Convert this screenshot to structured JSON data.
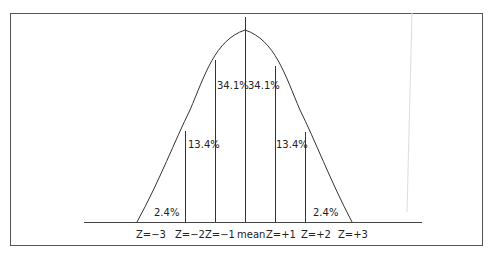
{
  "diagram": {
    "percentages": {
      "left_tail": "2.4%",
      "left_mid": "13.4%",
      "left_center": "34.1%",
      "right_center": "34.1%",
      "right_mid": "13.4%",
      "right_tail": "2.4%"
    },
    "axis_labels": [
      "Z=−3",
      "Z=−2",
      "Z=−1",
      "mean",
      "Z=+1",
      "Z=+2",
      "Z=+3"
    ],
    "colors": {
      "line": "#333333",
      "border": "#555555",
      "background": "#ffffff"
    }
  }
}
